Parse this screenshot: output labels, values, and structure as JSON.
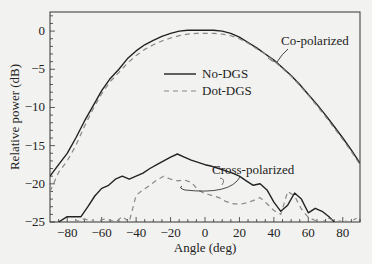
{
  "chart_data": {
    "type": "line",
    "title": "",
    "xlabel": "Angle (deg)",
    "ylabel": "Relative power (dB)",
    "xlim": [
      -90,
      90
    ],
    "ylim": [
      -25,
      2.5
    ],
    "xticks": [
      -80,
      -60,
      -40,
      -20,
      0,
      20,
      40,
      60,
      80
    ],
    "yticks": [
      0,
      -5,
      -10,
      -15,
      -20,
      -25
    ],
    "grid": false,
    "legend": {
      "position": "center-upper",
      "entries": [
        {
          "label": "No-DGS",
          "style": "solid"
        },
        {
          "label": "Dot-DGS",
          "style": "dashed"
        }
      ]
    },
    "annotations": [
      "Co-polarized",
      "Cross-polarized"
    ],
    "series": [
      {
        "name": "No-DGS co-polarized",
        "style": "solid",
        "x": [
          -90,
          -85,
          -80,
          -75,
          -70,
          -65,
          -60,
          -55,
          -50,
          -45,
          -40,
          -35,
          -30,
          -25,
          -20,
          -15,
          -10,
          -5,
          0,
          5,
          10,
          15,
          20,
          25,
          30,
          35,
          40,
          45,
          50,
          55,
          60,
          65,
          70,
          75,
          80,
          85,
          90
        ],
        "y": [
          -19.0,
          -17.5,
          -16.0,
          -14.0,
          -11.8,
          -9.8,
          -7.8,
          -6.2,
          -5.0,
          -3.6,
          -2.6,
          -1.8,
          -1.2,
          -0.7,
          -0.3,
          0.0,
          0.1,
          0.1,
          0.1,
          0.1,
          0.0,
          -0.3,
          -0.8,
          -1.5,
          -2.2,
          -3.0,
          -3.8,
          -4.8,
          -5.8,
          -7.0,
          -8.3,
          -9.6,
          -11.0,
          -12.5,
          -14.0,
          -15.6,
          -17.3
        ]
      },
      {
        "name": "Dot-DGS co-polarized",
        "style": "dashed",
        "x": [
          -90,
          -85,
          -80,
          -75,
          -70,
          -65,
          -60,
          -55,
          -50,
          -45,
          -40,
          -35,
          -30,
          -25,
          -20,
          -15,
          -10,
          -5,
          0,
          5,
          10,
          15,
          20,
          25,
          30,
          35,
          40,
          45,
          50,
          55,
          60,
          65,
          70,
          75,
          80,
          85,
          90
        ],
        "y": [
          -21.0,
          -18.5,
          -17.0,
          -15.0,
          -12.5,
          -10.2,
          -8.2,
          -6.6,
          -5.4,
          -4.2,
          -3.2,
          -2.4,
          -1.8,
          -1.3,
          -0.9,
          -0.6,
          -0.4,
          -0.3,
          -0.3,
          -0.3,
          -0.4,
          -0.6,
          -1.0,
          -1.6,
          -2.3,
          -3.0,
          -3.9,
          -4.9,
          -5.9,
          -7.1,
          -8.4,
          -9.8,
          -11.2,
          -12.7,
          -14.2,
          -15.8,
          -17.5
        ]
      },
      {
        "name": "No-DGS cross-polarized",
        "style": "solid",
        "x": [
          -85,
          -80,
          -76,
          -72,
          -68,
          -64,
          -60,
          -56,
          -52,
          -48,
          -44,
          -40,
          -36,
          -32,
          -28,
          -24,
          -20,
          -16,
          -12,
          -8,
          -4,
          0,
          4,
          8,
          12,
          16,
          20,
          24,
          28,
          32,
          36,
          40,
          44,
          48,
          52,
          56,
          60,
          64,
          68,
          72,
          75
        ],
        "y": [
          -25.0,
          -24.3,
          -24.3,
          -24.3,
          -23.0,
          -21.6,
          -20.6,
          -20.2,
          -19.4,
          -19.0,
          -19.4,
          -19.0,
          -18.6,
          -18.0,
          -17.5,
          -17.0,
          -16.5,
          -16.1,
          -16.5,
          -16.9,
          -17.2,
          -17.5,
          -17.7,
          -18.0,
          -18.3,
          -18.6,
          -19.0,
          -19.6,
          -20.2,
          -20.0,
          -20.8,
          -22.4,
          -23.6,
          -22.8,
          -21.2,
          -22.0,
          -23.8,
          -23.2,
          -23.6,
          -24.3,
          -25.0
        ]
      },
      {
        "name": "Dot-DGS cross-polarized",
        "style": "dashed",
        "x": [
          -76,
          -70,
          -64,
          -58,
          -52,
          -48,
          -44,
          -40,
          -36,
          -32,
          -28,
          -24,
          -20,
          -16,
          -12,
          -8,
          -4,
          0,
          4,
          8,
          12,
          16,
          20,
          24,
          28,
          32,
          36,
          40,
          44,
          48,
          52,
          56,
          60,
          64,
          68,
          72,
          76,
          80,
          84,
          88
        ],
        "y": [
          -25.0,
          -24.6,
          -25.0,
          -24.6,
          -25.0,
          -24.3,
          -25.0,
          -21.5,
          -20.8,
          -20.2,
          -19.5,
          -19.0,
          -19.4,
          -19.6,
          -19.5,
          -19.8,
          -20.8,
          -21.3,
          -21.5,
          -21.8,
          -22.3,
          -22.6,
          -22.7,
          -22.5,
          -22.2,
          -21.8,
          -22.6,
          -23.5,
          -24.0,
          -21.0,
          -21.6,
          -23.3,
          -24.4,
          -24.8,
          -25.0,
          -24.5,
          -25.0,
          -24.8,
          -25.0,
          -24.5
        ]
      }
    ]
  }
}
